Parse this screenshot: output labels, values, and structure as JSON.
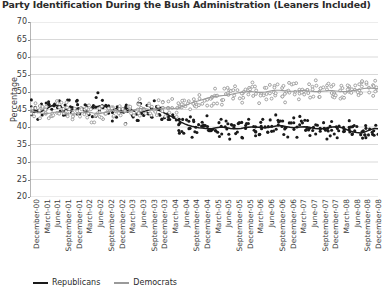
{
  "chart": {
    "title": "Party Identification During the Bush Administration (Leaners Included)",
    "ylabel": "Percentage"
  },
  "legend": {
    "items": [
      {
        "label": "Republicans",
        "color": "#1a1a1a"
      },
      {
        "label": "Democrats",
        "color": "#9a9a9a"
      }
    ]
  },
  "chart_data": {
    "type": "scatter",
    "title": "Party Identification During the Bush Administration (Leaners Included)",
    "xlabel": "",
    "ylabel": "Percentage",
    "ylim": [
      20,
      70
    ],
    "yticks": [
      20,
      25,
      30,
      35,
      40,
      45,
      50,
      55,
      60,
      65,
      70
    ],
    "grid": true,
    "legend_position": "bottom-left",
    "x_tick_labels": [
      "December-00",
      "March-01",
      "June-01",
      "September-01",
      "December-01",
      "March-02",
      "June-02",
      "September-02",
      "December-02",
      "March-03",
      "June-03",
      "September-03",
      "December-03",
      "March-04",
      "June-04",
      "September-04",
      "December-04",
      "March-05",
      "June-05",
      "September-05",
      "December-05",
      "March-06",
      "June-06",
      "September-06",
      "December-06",
      "March-07",
      "June-07",
      "September-07",
      "December-07",
      "March-08",
      "June-08",
      "September-08",
      "December-08"
    ],
    "series": [
      {
        "name": "Republicans",
        "color": "#1a1a1a",
        "marker": "filled-circle",
        "trend_line": true,
        "trend_values": [
          45.2,
          45.0,
          44.6,
          44.3,
          44.8,
          45.4,
          46.0,
          46.3,
          46.1,
          45.6,
          45.1,
          44.8,
          44.9,
          45.2,
          45.5,
          45.4,
          45.0,
          45.1,
          45.4,
          45.8,
          46.1,
          46.0,
          45.6,
          45.2,
          45.0,
          45.1,
          45.3,
          45.4,
          45.2,
          44.8,
          44.4,
          44.2,
          44.3,
          44.6,
          44.9,
          45.1,
          45.0,
          44.6,
          44.1,
          43.6,
          43.1,
          42.6,
          42.0,
          41.4,
          40.9,
          40.5,
          40.2,
          40.0,
          39.8,
          39.7,
          39.6,
          39.5,
          39.6,
          39.8,
          39.9,
          39.9,
          39.8,
          39.6,
          39.5,
          39.5,
          39.6,
          39.8,
          39.9,
          40.0,
          40.0,
          39.9,
          39.8,
          39.8,
          39.9,
          40.1,
          40.3,
          40.4,
          40.3,
          40.1,
          39.9,
          39.8,
          39.9,
          40.0,
          40.1,
          40.0,
          39.8,
          39.6,
          39.5,
          39.5,
          39.6,
          39.8,
          40.0,
          40.1,
          40.0,
          39.7,
          39.3,
          38.9,
          38.6,
          38.4,
          38.3,
          38.5,
          38.9,
          39.3,
          39.6,
          39.5
        ],
        "scatter_spread": 3.4
      },
      {
        "name": "Democrats",
        "color": "#9a9a9a",
        "marker": "open-circle",
        "trend_line": true,
        "trend_values": [
          44.6,
          44.4,
          44.2,
          44.0,
          43.9,
          43.9,
          44.0,
          44.2,
          44.3,
          44.2,
          44.0,
          43.8,
          43.7,
          43.8,
          44.0,
          44.2,
          44.3,
          44.2,
          44.0,
          43.9,
          43.9,
          44.1,
          44.4,
          44.6,
          44.7,
          44.6,
          44.4,
          44.3,
          44.4,
          44.7,
          45.0,
          45.2,
          45.3,
          45.2,
          45.0,
          44.9,
          45.0,
          45.2,
          45.4,
          45.5,
          45.4,
          45.3,
          45.4,
          45.7,
          46.1,
          46.5,
          46.9,
          47.2,
          47.5,
          47.8,
          48.1,
          48.4,
          48.6,
          48.8,
          48.9,
          49.0,
          49.1,
          49.3,
          49.5,
          49.7,
          49.9,
          50.0,
          50.1,
          50.1,
          50.0,
          49.9,
          49.9,
          50.0,
          50.2,
          50.4,
          50.5,
          50.5,
          50.4,
          50.3,
          50.2,
          50.2,
          50.3,
          50.4,
          50.4,
          50.3,
          50.2,
          50.1,
          50.1,
          50.2,
          50.3,
          50.4,
          50.4,
          50.3,
          50.2,
          50.1,
          50.1,
          50.2,
          50.4,
          50.6,
          50.8,
          51.0,
          51.1,
          51.1,
          51.0,
          50.9
        ],
        "scatter_spread": 3.2
      }
    ]
  }
}
